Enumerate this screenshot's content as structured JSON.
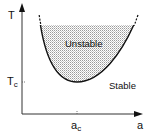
{
  "diagram": {
    "type": "stability-phase-diagram",
    "axes": {
      "y_label": "T",
      "x_label": "a",
      "y_tick_label_main": "T",
      "y_tick_label_sub": "c",
      "x_tick_label_main": "a",
      "x_tick_label_sub": "c"
    },
    "regions": {
      "unstable_label": "Unstable",
      "stable_label": "Stable"
    },
    "colors": {
      "line": "#111111",
      "shade": "#bdbdbd",
      "axis": "#333333"
    }
  }
}
